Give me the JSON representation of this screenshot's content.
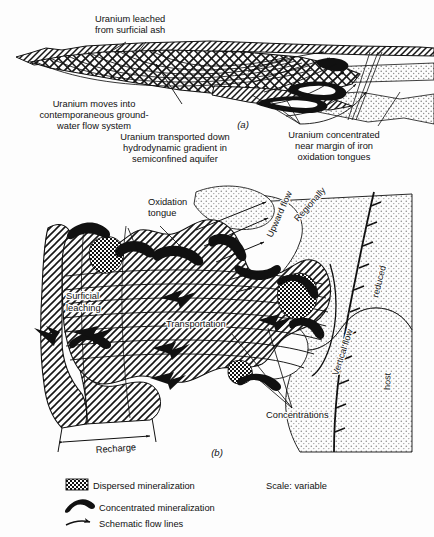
{
  "figure": {
    "scale_note": "Scale: variable",
    "panel_a": {
      "id": "(a)",
      "labels": {
        "leached": [
          "Uranium leached",
          "from surficial ash"
        ],
        "moves_into": [
          "Uranium moves into",
          "contemporaneous ground-",
          "water flow system"
        ],
        "transported": [
          "Uranium transported down",
          "hydrodynamic gradient in",
          "semiconfined aquifer"
        ],
        "concentrated": [
          "Uranium concentrated",
          "near margin of iron",
          "oxidation tongues"
        ]
      }
    },
    "panel_b": {
      "id": "(b)",
      "labels": {
        "oxidation_tongue": [
          "Oxidation",
          "tongue"
        ],
        "surficial_leaching": [
          "Surficial",
          "leaching"
        ],
        "transportation": "Transportation",
        "concentrations": "Concentrations",
        "recharge": "Recharge",
        "upward_flow": "Upward flow",
        "vertical_flow": "Vertical flow",
        "regionally": "Regionally",
        "reduced": "reduced",
        "host": "host"
      }
    },
    "legend": {
      "title": "",
      "items": [
        {
          "symbol": "dispersed-mineralization-swatch",
          "label": "Dispersed mineralization"
        },
        {
          "symbol": "concentrated-mineralization-swatch",
          "label": "Concentrated mineralization"
        },
        {
          "symbol": "schematic-flow-line-swatch",
          "label": "Schematic flow lines"
        }
      ]
    },
    "colors": {
      "ink": "#111111",
      "paper": "#fdfdfd",
      "stipple": "#c9c9c9",
      "hatch": "#1a1a1a"
    }
  }
}
